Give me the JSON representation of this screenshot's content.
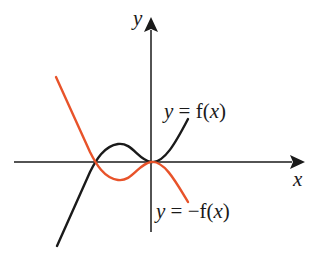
{
  "diagram": {
    "axes": {
      "x_label": "x",
      "y_label": "y"
    },
    "curves": [
      {
        "name": "f",
        "label": "y = f(x)",
        "color": "#1a1a1a"
      },
      {
        "name": "neg_f",
        "label": "y = −f(x)",
        "color": "#e8532a"
      }
    ]
  },
  "labels": {
    "y_axis": "y",
    "x_axis": "x",
    "f_y": "y",
    "f_eq": " = f(",
    "f_x": "x",
    "f_close": ")",
    "nf_y": "y",
    "nf_eq": " = −f(",
    "nf_x": "x",
    "nf_close": ")"
  }
}
